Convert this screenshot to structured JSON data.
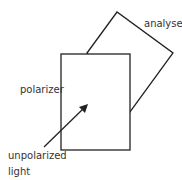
{
  "diagram": {
    "labels": {
      "analyser": "analyser",
      "polarizer": "polarizer",
      "unpolarized_line1": "unpolarized",
      "unpolarized_line2": "light"
    },
    "colors": {
      "stroke": "#222222",
      "fill": "#ffffff",
      "text": "#333333"
    }
  }
}
